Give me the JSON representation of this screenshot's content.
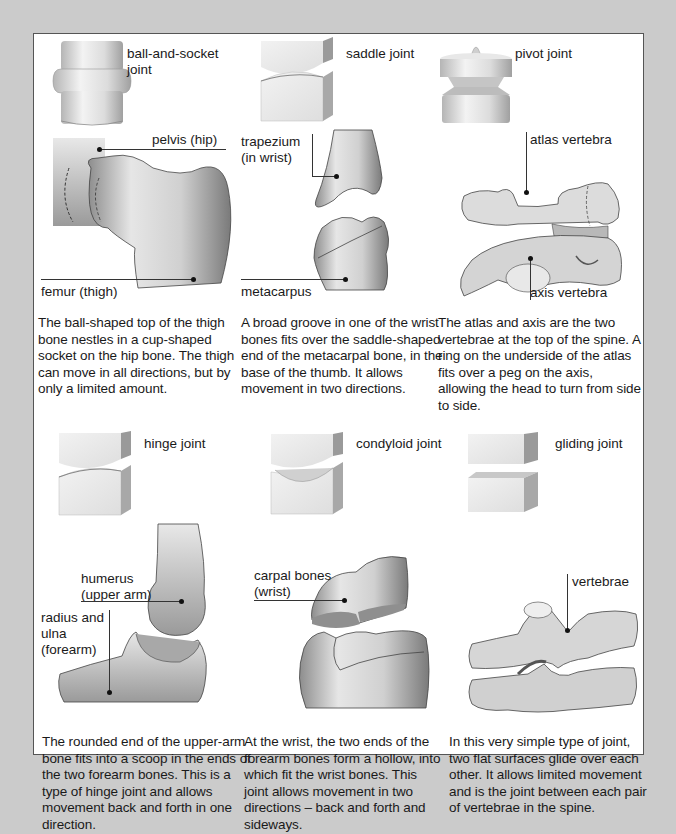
{
  "page": {
    "background_color": "#cbcbcb",
    "panel_color": "#ffffff"
  },
  "joints": [
    {
      "title": "ball-and-socket joint",
      "title_lines": [
        "ball-and-socket",
        "joint"
      ],
      "labels": [
        "pelvis (hip)",
        "femur (thigh)"
      ],
      "caption": "The ball-shaped top of the thigh bone nestles in a cup-shaped socket on the hip bone. The thigh can move in all directions, but by only a limited amount."
    },
    {
      "title": "saddle joint",
      "labels": [
        "trapezium",
        "(in wrist)",
        "metacarpus"
      ],
      "caption": "A broad groove in one of the wrist bones fits over the saddle-shaped end of the metacarpal bone, in the base of the thumb. It allows movement in two directions."
    },
    {
      "title": "pivot joint",
      "labels": [
        "atlas vertebra",
        "axis vertebra"
      ],
      "caption": "The atlas and axis are the two vertebrae at the top of the spine. A ring on the underside of the atlas fits over a peg on the axis, allowing the head to turn from side to side."
    },
    {
      "title": "hinge joint",
      "labels": [
        "humerus",
        "(upper arm)",
        "radius and",
        "ulna",
        "(forearm)"
      ],
      "caption": "The rounded end of the upper-arm bone fits into a scoop in the ends of the two forearm bones. This is a type of hinge joint and allows movement back and forth in one direction."
    },
    {
      "title": "condyloid joint",
      "labels": [
        "carpal bones",
        "(wrist)"
      ],
      "caption": "At the wrist, the two ends of the forearm bones form a hollow, into which fit the wrist bones. This joint allows movement in two directions – back and forth and sideways."
    },
    {
      "title": "gliding joint",
      "labels": [
        "vertebrae"
      ],
      "caption": "In this very simple type of joint, two flat surfaces glide over each other. It allows limited movement and is the joint between each pair of vertebrae in the spine."
    }
  ]
}
